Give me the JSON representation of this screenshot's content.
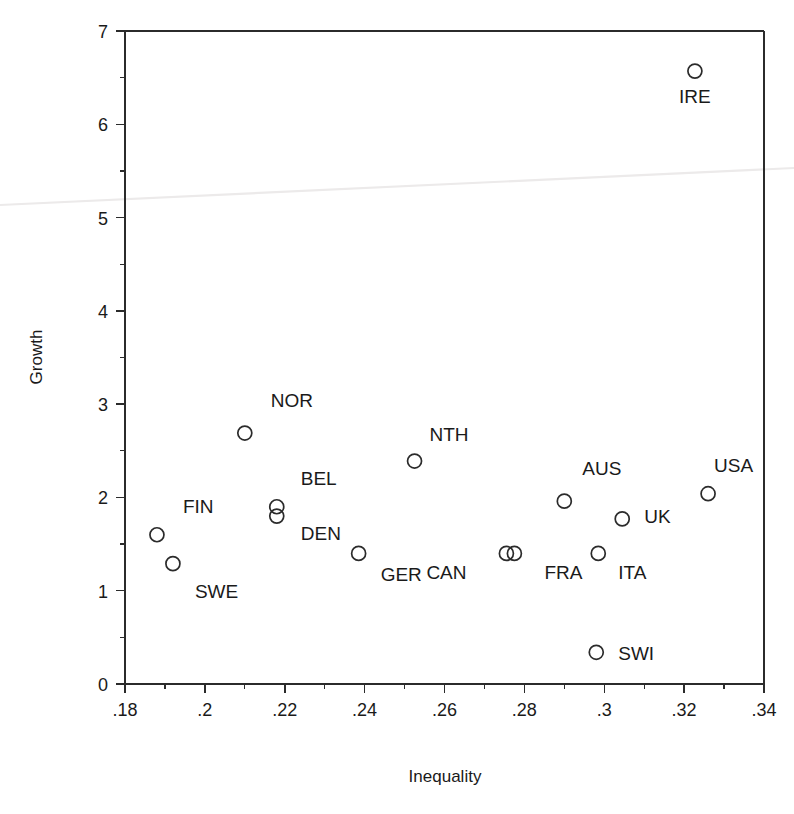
{
  "chart_data": {
    "type": "scatter",
    "title": "",
    "xlabel": "Inequality",
    "ylabel": "Growth",
    "xlim": [
      0.18,
      0.34
    ],
    "ylim": [
      0,
      7
    ],
    "grid": false,
    "legend": "none",
    "x_ticks": [
      ".18",
      ".2",
      ".22",
      ".24",
      ".26",
      ".28",
      ".3",
      ".32",
      ".34"
    ],
    "x_tick_values": [
      0.18,
      0.2,
      0.22,
      0.24,
      0.26,
      0.28,
      0.3,
      0.32,
      0.34
    ],
    "x_minor_tick_values": [
      0.19,
      0.21,
      0.23,
      0.25,
      0.27,
      0.29,
      0.31,
      0.33
    ],
    "y_ticks": [
      "0",
      "1",
      "2",
      "3",
      "4",
      "5",
      "6",
      "7"
    ],
    "y_tick_values": [
      0,
      1,
      2,
      3,
      4,
      5,
      6,
      7
    ],
    "y_minor_tick_values": [
      0.5,
      1.5,
      2.5,
      3.5,
      4.5,
      5.5,
      6.5
    ],
    "marker_style": "open-circle",
    "marker_color": "#2b2b2b",
    "points": [
      {
        "label": "FIN",
        "x": 0.188,
        "y": 1.6,
        "label_dx": 26,
        "label_dy": -22
      },
      {
        "label": "SWE",
        "x": 0.192,
        "y": 1.29,
        "label_dx": 22,
        "label_dy": 34
      },
      {
        "label": "NOR",
        "x": 0.21,
        "y": 2.69,
        "label_dx": 26,
        "label_dy": -26
      },
      {
        "label": "BEL",
        "x": 0.218,
        "y": 1.9,
        "label_dx": 24,
        "label_dy": -22
      },
      {
        "label": "DEN",
        "x": 0.218,
        "y": 1.8,
        "label_dx": 24,
        "label_dy": 24
      },
      {
        "label": "GER",
        "x": 0.2385,
        "y": 1.4,
        "label_dx": 22,
        "label_dy": 28
      },
      {
        "label": "NTH",
        "x": 0.2525,
        "y": 2.39,
        "label_dx": 15,
        "label_dy": -20
      },
      {
        "label": "CAN",
        "x": 0.2755,
        "y": 1.4,
        "label_dx": -80,
        "label_dy": 26
      },
      {
        "label": "FRA",
        "x": 0.2775,
        "y": 1.4,
        "label_dx": 30,
        "label_dy": 26
      },
      {
        "label": "AUS",
        "x": 0.29,
        "y": 1.96,
        "label_dx": 18,
        "label_dy": -26
      },
      {
        "label": "ITA",
        "x": 0.2985,
        "y": 1.4,
        "label_dx": 20,
        "label_dy": 26
      },
      {
        "label": "SWI",
        "x": 0.298,
        "y": 0.34,
        "label_dx": 22,
        "label_dy": 8
      },
      {
        "label": "UK",
        "x": 0.3045,
        "y": 1.77,
        "label_dx": 22,
        "label_dy": 4
      },
      {
        "label": "USA",
        "x": 0.326,
        "y": 2.04,
        "label_dx": 6,
        "label_dy": -22
      },
      {
        "label": "IRE",
        "x": 0.3227,
        "y": 6.57,
        "label_dx": 0,
        "label_dy": 32
      }
    ]
  },
  "axes": {
    "x_axis_label": "Inequality",
    "y_axis_label": "Growth"
  }
}
